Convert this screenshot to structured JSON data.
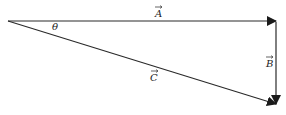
{
  "diagram": {
    "type": "vector-triangle",
    "vectors": [
      {
        "name": "A",
        "label": "A",
        "from": [
          8,
          21
        ],
        "to": [
          276,
          21
        ]
      },
      {
        "name": "B",
        "label": "B",
        "from": [
          276,
          21
        ],
        "to": [
          276,
          104
        ]
      },
      {
        "name": "C",
        "label": "C",
        "from": [
          8,
          21
        ],
        "to": [
          276,
          104
        ]
      }
    ],
    "angle_label": "θ",
    "colors": {
      "stroke": "#2a2a2a",
      "background": "#ffffff"
    }
  }
}
